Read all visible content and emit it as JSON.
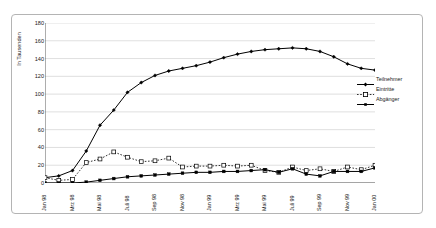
{
  "page": {
    "header_remnant": ""
  },
  "chart_data": {
    "type": "line",
    "title": "",
    "subtitle": "",
    "xlabel": "",
    "ylabel": "In Tausenden",
    "ylim": [
      0,
      180
    ],
    "ytick_step": 20,
    "ytick_labels": [
      "0",
      "20",
      "40",
      "60",
      "80",
      "100",
      "120",
      "140",
      "160",
      "180"
    ],
    "grid": true,
    "grid_axis": "y",
    "legend_position": "right",
    "x": [
      "Jan 98",
      "Feb 98",
      "Mrz 98",
      "Apr 98",
      "Mai 98",
      "Jun 98",
      "Juli 98",
      "Aug 98",
      "Sep 98",
      "Okt 98",
      "Nov 98",
      "Dez 98",
      "Jan 99",
      "Feb 99",
      "Mrz 99",
      "Apr 99",
      "Mai 99",
      "Jun 99",
      "Juli 99",
      "Aug 99",
      "Sep 99",
      "Okt 99",
      "Nov 99",
      "Dez 99",
      "Jan 00"
    ],
    "xtick_labels": [
      "Jan 98",
      "Mrz 98",
      "Mai 98",
      "Juli 98",
      "Sep 98",
      "Nov 98",
      "Jan 99",
      "Mrz 99",
      "Mai 99",
      "Juli 99",
      "Sep 99",
      "Nov 99",
      "Jan 00"
    ],
    "xtick_indices": [
      0,
      2,
      4,
      6,
      8,
      10,
      12,
      14,
      16,
      18,
      20,
      22,
      24
    ],
    "series": [
      {
        "name": "Teilnehmer",
        "marker": "filled-diamond",
        "line_style": "solid",
        "color": "#000000",
        "values": [
          6,
          8,
          14,
          36,
          65,
          82,
          102,
          113,
          121,
          126,
          129,
          132,
          136,
          141,
          145,
          148,
          150,
          151,
          152,
          151,
          148,
          142,
          134,
          129,
          127
        ]
      },
      {
        "name": "Eintritte",
        "marker": "open-square",
        "line_style": "dotted",
        "color": "#000000",
        "values": [
          6,
          3,
          4,
          23,
          27,
          35,
          29,
          24,
          25,
          28,
          18,
          19,
          19,
          20,
          19,
          20,
          14,
          12,
          18,
          14,
          16,
          13,
          18,
          15,
          20
        ]
      },
      {
        "name": "Abgänger",
        "marker": "filled-square",
        "line_style": "solid",
        "color": "#000000",
        "values": [
          0,
          0,
          0,
          1,
          3,
          5,
          7,
          8,
          9,
          10,
          11,
          12,
          12,
          13,
          13,
          14,
          15,
          12,
          16,
          10,
          8,
          13,
          13,
          13,
          17
        ]
      }
    ]
  },
  "legend": {
    "items": [
      {
        "label": "Teilnehmer"
      },
      {
        "label": "Eintritte"
      },
      {
        "label": "Abgänger"
      }
    ]
  }
}
